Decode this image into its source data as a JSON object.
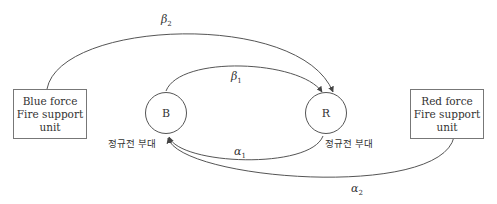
{
  "blue_unit": {
    "line1": "Blue force",
    "line2": "Fire support",
    "line3": "unit"
  },
  "red_unit": {
    "line1": "Red force",
    "line2": "Fire support",
    "line3": "unit"
  },
  "node_b": {
    "label": "B",
    "caption": "정규전 부대"
  },
  "node_r": {
    "label": "R",
    "caption": "정규전 부대"
  },
  "edges": {
    "beta1": {
      "symbol": "β",
      "sub": "1",
      "from": "B",
      "to": "R"
    },
    "beta2": {
      "symbol": "β",
      "sub": "2",
      "from": "Blue force Fire support unit",
      "to": "R"
    },
    "alpha1": {
      "symbol": "α",
      "sub": "1",
      "from": "R",
      "to": "B"
    },
    "alpha2": {
      "symbol": "α",
      "sub": "2",
      "from": "Red force Fire support unit",
      "to": "B"
    }
  }
}
